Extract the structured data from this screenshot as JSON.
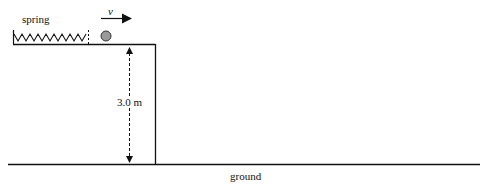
{
  "diagram": {
    "labels": {
      "spring": "spring",
      "velocity": "v",
      "height": "3.0 m",
      "ground": "ground"
    },
    "colors": {
      "line": "#111111",
      "ball_fill": "#9a9a9a",
      "background": "#ffffff"
    }
  }
}
